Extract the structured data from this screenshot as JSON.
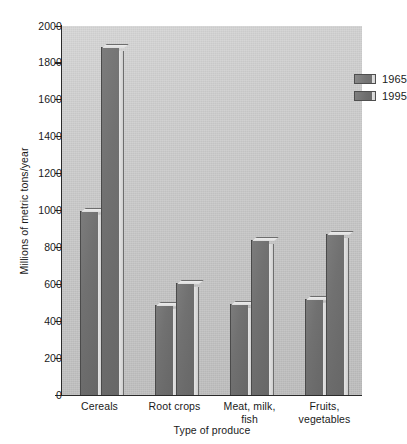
{
  "chart_data": {
    "type": "bar",
    "title": "",
    "xlabel": "Type of produce",
    "ylabel": "Millions of metric tons/year",
    "ylim": [
      0,
      2000
    ],
    "ytick_step": 200,
    "yticks": [
      2000,
      1800,
      1600,
      1400,
      1200,
      1000,
      800,
      600,
      400,
      200,
      0
    ],
    "ytick_labels": [
      "2000",
      "1800",
      "1600",
      "1400",
      "1200",
      "1000",
      "800",
      "600",
      "400",
      "200",
      "0"
    ],
    "grid": false,
    "legend_position": "top-right",
    "categories": [
      "Cereals",
      "Root crops",
      "Meat, milk, fish",
      "Fruits, vegetables"
    ],
    "category_label_lines": [
      [
        "Cereals"
      ],
      [
        "Root crops"
      ],
      [
        "Meat, milk,",
        "fish"
      ],
      [
        "Fruits,",
        "vegetables"
      ]
    ],
    "series": [
      {
        "name": "1965",
        "color": "#757575",
        "values": [
          1000,
          490,
          495,
          520
        ]
      },
      {
        "name": "1995",
        "color": "#6e6e6e",
        "values": [
          1885,
          608,
          840,
          875
        ]
      }
    ]
  },
  "legend": {
    "entries": [
      {
        "label": "1965"
      },
      {
        "label": "1995"
      }
    ]
  },
  "colors": {
    "bar_fill": "#717171",
    "bar_edge": "#3b3b3b",
    "plot_background": "#c9c9c9",
    "axis": "#2a2a2a",
    "text": "#1a1a1a",
    "page_background": "#ffffff"
  }
}
